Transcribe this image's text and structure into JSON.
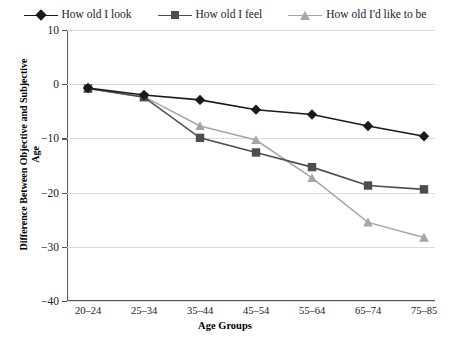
{
  "chart_data": {
    "type": "line",
    "title": "",
    "xlabel": "Age Groups",
    "ylabel": "Difference Between Objective and Subjective Age",
    "categories": [
      "20–24",
      "25–34",
      "35–44",
      "45–54",
      "55–64",
      "65–74",
      "75–85"
    ],
    "ylim": [
      -40,
      10
    ],
    "yticks": [
      10,
      0,
      -10,
      -20,
      -30,
      -40
    ],
    "ytick_labels": [
      "10",
      "0",
      "−10",
      "−20",
      "−30",
      "−40"
    ],
    "grid": true,
    "legend_position": "top",
    "series": [
      {
        "name": "How old I look",
        "marker": "diamond",
        "color": "#1a1a1a",
        "values": [
          -0.7,
          -2.0,
          -2.9,
          -4.7,
          -5.6,
          -7.7,
          -9.6
        ]
      },
      {
        "name": "How old I feel",
        "marker": "square",
        "color": "#4d4d4d",
        "values": [
          -0.8,
          -2.4,
          -9.9,
          -12.6,
          -15.3,
          -18.7,
          -19.4
        ]
      },
      {
        "name": "How old I'd like to be",
        "marker": "triangle",
        "color": "#a6a6a6",
        "values": [
          -0.8,
          -2.3,
          -7.7,
          -10.3,
          -17.3,
          -25.5,
          -28.3
        ]
      }
    ]
  },
  "legend": {
    "items": [
      {
        "label": "How old I look"
      },
      {
        "label": "How old I feel"
      },
      {
        "label": "How old I'd like to be"
      }
    ]
  },
  "axes": {
    "x_title": "Age Groups",
    "y_title": "Difference Between Objective and Subjective Age"
  },
  "colors": {
    "series_look": "#1a1a1a",
    "series_feel": "#4d4d4d",
    "series_like": "#a6a6a6",
    "grid": "#dcdcdc",
    "axis": "#555555",
    "background": "#ffffff"
  }
}
